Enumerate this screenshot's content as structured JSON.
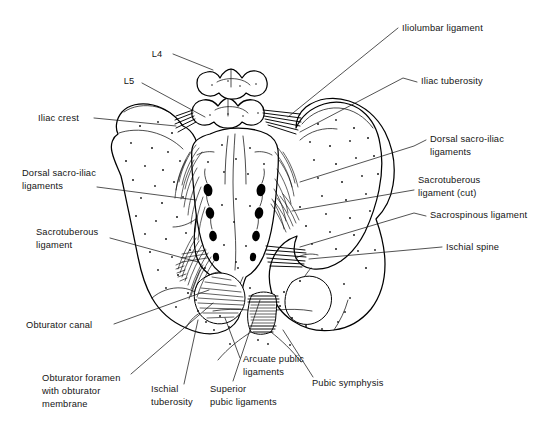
{
  "figure": {
    "width": 556,
    "height": 431,
    "background_color": "#ffffff",
    "ink_color": "#000000",
    "style": "black-and-white anatomical line drawing with stipple shading"
  },
  "labels": [
    {
      "id": "l4",
      "text": "L4",
      "x": 157,
      "y": 57,
      "anchor": "middle",
      "leader": "M 173,54 L 213,70"
    },
    {
      "id": "l5",
      "text": "L5",
      "x": 129,
      "y": 84,
      "anchor": "middle",
      "leader": "M 142,83 L 205,117"
    },
    {
      "id": "iliac-crest",
      "text": "Iliac crest",
      "x": 38,
      "y": 121,
      "anchor": "start",
      "leader": "M 94,118 L 176,126"
    },
    {
      "id": "dorsal-sacro-iliac-ligaments-left",
      "text": "Dorsal sacro-iliac\nligaments",
      "x": 22,
      "y": 176,
      "anchor": "start",
      "leader": "M 97,187 L 196,200"
    },
    {
      "id": "sacrotuberous-ligament-left",
      "text": "Sacrotuberous\nligament",
      "x": 36,
      "y": 235,
      "anchor": "start",
      "leader": "M 110,238 L 198,262"
    },
    {
      "id": "obturator-canal",
      "text": "Obturator canal",
      "x": 26,
      "y": 328,
      "anchor": "start",
      "leader": "M 114,324 L 209,290"
    },
    {
      "id": "obturator-foramen",
      "text": "Obturator foramen\nwith obturator\nmembrane",
      "x": 42,
      "y": 381,
      "anchor": "start",
      "leader": "M 131,374 L 213,303"
    },
    {
      "id": "ischial-tuberosity",
      "text": "Ischial\ntuberosity",
      "x": 151,
      "y": 392,
      "anchor": "start",
      "leader": "M 184,384 L 198,320"
    },
    {
      "id": "superior-pubic-ligaments",
      "text": "Superior\npubic ligaments",
      "x": 210,
      "y": 392,
      "anchor": "start",
      "leader": "M 233,381 L 260,300"
    },
    {
      "id": "arcuate-pubic-ligaments",
      "text": "Arcuate public\nligaments",
      "x": 243,
      "y": 362,
      "anchor": "start",
      "leader": "M 240,358 L 225,318"
    },
    {
      "id": "pubic-symphysis",
      "text": "Pubic symphysis",
      "x": 312,
      "y": 386,
      "anchor": "start",
      "leader": "M 313,377 L 283,330"
    },
    {
      "id": "iliolumbar-ligament",
      "text": "Iliolumbar ligament",
      "x": 402,
      "y": 31,
      "anchor": "start",
      "leader": "M 398,28 L 288,117"
    },
    {
      "id": "iliac-tuberosity",
      "text": "Iliac tuberosity",
      "x": 421,
      "y": 84,
      "anchor": "start",
      "leader": "M 417,82 L 403,78 L 300,132"
    },
    {
      "id": "dorsal-sacro-iliac-ligaments-right",
      "text": "Dorsal sacro-iliac\nligaments",
      "x": 430,
      "y": 142,
      "anchor": "start",
      "leader": "M 426,140 L 414,146 L 300,182"
    },
    {
      "id": "sacrotuberous-ligament-cut",
      "text": "Sacrotuberous\nligament (cut)",
      "x": 418,
      "y": 183,
      "anchor": "start",
      "leader": "M 414,190 L 292,211"
    },
    {
      "id": "sacrospinous-ligament",
      "text": "Sacrospinous ligament",
      "x": 430,
      "y": 218,
      "anchor": "start",
      "leader": "M 426,216 L 414,213 L 300,247"
    },
    {
      "id": "ischial-spine",
      "text": "Ischial spine",
      "x": 446,
      "y": 250,
      "anchor": "start",
      "leader": "M 442,247 L 309,259"
    }
  ],
  "anatomy": {
    "structures": [
      "L4 vertebra",
      "L5 vertebra",
      "Sacrum",
      "Coccyx",
      "Left hip bone (ilium, ischium, pubis)",
      "Right hip bone (ilium, ischium, pubis)",
      "Iliac crest",
      "Iliac tuberosity",
      "Ischial spine",
      "Ischial tuberosity",
      "Obturator foramen",
      "Obturator canal",
      "Pubic symphysis",
      "Posterior sacral foramina"
    ],
    "ligaments": [
      "Iliolumbar ligament",
      "Dorsal sacro-iliac ligaments",
      "Sacrotuberous ligament",
      "Sacrospinous ligament",
      "Superior pubic ligaments",
      "Arcuate pubic ligaments",
      "Obturator membrane"
    ]
  }
}
